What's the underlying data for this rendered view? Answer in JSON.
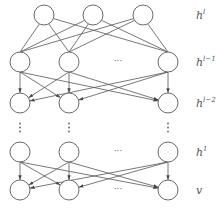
{
  "diagram": {
    "type": "deep belief network",
    "colors": {
      "node_stroke": "#6a6a6a",
      "edge": "#555555",
      "label": "#555555"
    },
    "layers": [
      {
        "id": "hl",
        "label_base": "h",
        "label_sup": "l",
        "nodes": 3,
        "has_ellipsis": false
      },
      {
        "id": "hl1",
        "label_base": "h",
        "label_sup": "l−1",
        "nodes": 3,
        "has_ellipsis": true
      },
      {
        "id": "hl2",
        "label_base": "h",
        "label_sup": "l−2",
        "nodes": 3,
        "has_ellipsis": false
      },
      {
        "id": "h1",
        "label_base": "h",
        "label_sup": "1",
        "nodes": 3,
        "has_ellipsis": true
      },
      {
        "id": "v",
        "label_base": "v",
        "label_sup": "",
        "nodes": 3,
        "has_ellipsis": true
      }
    ],
    "connections": [
      {
        "from": "hl",
        "to": "hl1",
        "directed": false
      },
      {
        "from": "hl1",
        "to": "hl2",
        "directed": true
      },
      {
        "from": "h1",
        "to": "v",
        "directed": true
      }
    ],
    "ellipsis_text": "···",
    "vertical_ellipsis_between": [
      "hl2",
      "h1"
    ]
  }
}
